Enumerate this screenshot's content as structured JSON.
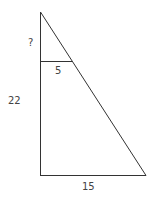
{
  "diagram": {
    "type": "similar-triangles",
    "line_color": "#333333",
    "labels": {
      "unknown_segment": "?",
      "inner_base": "5",
      "lower_segment": "22",
      "outer_base": "15"
    }
  }
}
